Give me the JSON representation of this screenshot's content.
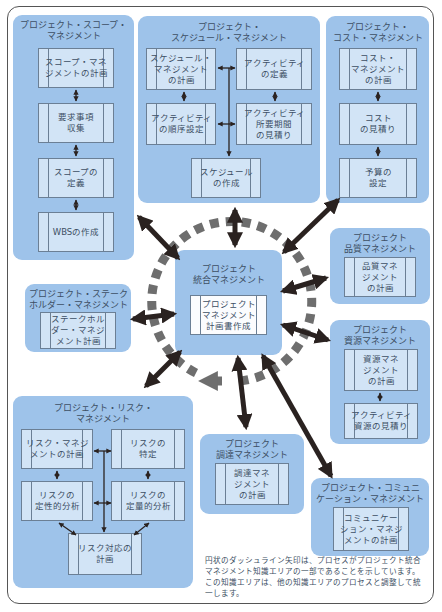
{
  "colors": {
    "area_fill": "#9ec3ea",
    "process_fill": "#d2e4f6",
    "text": "#3d4f64",
    "arrow": "#2a2220",
    "dashed_circle": "#6e6e6e"
  },
  "areas": {
    "scope": {
      "title": "プロジェクト・スコープ・\nマネジメント",
      "processes": [
        "スコープ・マネ\nジメントの計画",
        "要求事項\n収集",
        "スコープの\n定義",
        "WBSの作成"
      ]
    },
    "schedule": {
      "title": "プロジェクト・\nスケジュール・マネジメント",
      "processes": [
        "スケジュール・\nマネジメント\nの計画",
        "アクティビティ\nの定義",
        "アクティビティ\nの順序設定",
        "アクティビティ\n所要期間\nの見積り",
        "スケジュール\nの作成"
      ]
    },
    "cost": {
      "title": "プロジェクト・\nコスト・マネジメント",
      "processes": [
        "コスト・\nマネジメント\nの計画",
        "コスト\nの見積り",
        "予算の\n設定"
      ]
    },
    "integration": {
      "title": "プロジェクト\n統合マネジメント",
      "processes": [
        "プロジェクト\nマネジメント\n計画書作成"
      ]
    },
    "quality": {
      "title": "プロジェクト\n品質マネジメント",
      "processes": [
        "品質マネ\nジメント\nの計画"
      ]
    },
    "stakeholder": {
      "title": "プロジェクト・ステーク\nホルダー・マネジメント",
      "processes": [
        "ステークホル\nダー・マネジ\nメント計画"
      ]
    },
    "resource": {
      "title": "プロジェクト\n資源マネジメント",
      "processes": [
        "資源マネ\nジメント\nの計画",
        "アクティビティ\n資源の見積り"
      ]
    },
    "risk": {
      "title": "プロジェクト・リスク・\nマネジメント",
      "processes": [
        "リスク・マネジ\nメントの計画",
        "リスクの\n特定",
        "リスクの\n定性的分析",
        "リスクの\n定量的分析",
        "リスク対応の\n計画"
      ]
    },
    "procurement": {
      "title": "プロジェクト\n調達マネジメント",
      "processes": [
        "調達マネ\nジメント\nの計画"
      ]
    },
    "communication": {
      "title": "プロジェクト・コミュニ\nケーション・マネジメント",
      "processes": [
        "コミュニケー\nション・マネジ\nメントの計画"
      ]
    }
  },
  "note": "円状のダッシュライン矢印は、プロセスがプロジェクト統合\nマネジメント知識エリアの一部であることを示しています。\nこの知識エリアは、他の知識エリアのプロセスと調整して統\n一します。"
}
